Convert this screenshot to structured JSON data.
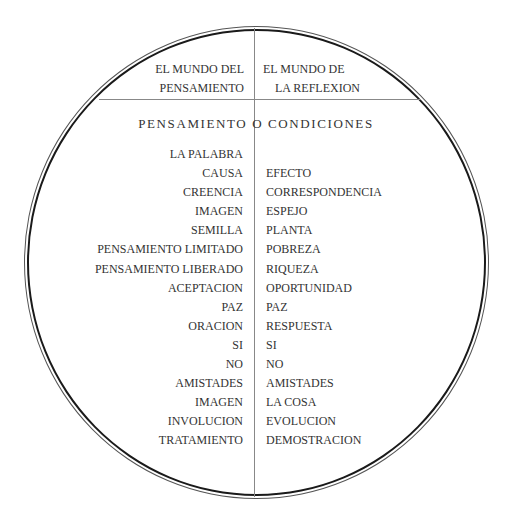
{
  "header": {
    "left": [
      "EL MUNDO DEL",
      "PENSAMIENTO"
    ],
    "right": [
      "EL MUNDO DE",
      "LA REFLEXION"
    ]
  },
  "subtitle": "PENSAMIENTO O CONDICIONES",
  "rows": {
    "left": [
      "LA PALABRA",
      "CAUSA",
      "CREENCIA",
      "IMAGEN",
      "SEMILLA",
      "PENSAMIENTO LIMITADO",
      "PENSAMIENTO LIBERADO",
      "ACEPTACION",
      "PAZ",
      "ORACION",
      "SI",
      "NO",
      "AMISTADES",
      "IMAGEN",
      "INVOLUCION",
      "TRATAMIENTO"
    ],
    "right": [
      "",
      "EFECTO",
      "CORRESPONDENCIA",
      "ESPEJO",
      "PLANTA",
      "POBREZA",
      "RIQUEZA",
      "OPORTUNIDAD",
      "PAZ",
      "RESPUESTA",
      "SI",
      "NO",
      "AMISTADES",
      "LA COSA",
      "EVOLUCION",
      "DEMOSTRACION"
    ]
  },
  "colors": {
    "text": "#333333",
    "circle": "#1a1a1a",
    "divider": "#888888"
  }
}
